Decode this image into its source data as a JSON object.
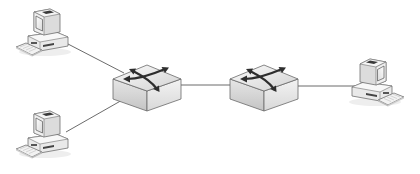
{
  "diagram": {
    "type": "network-topology",
    "background": "#ffffff",
    "colors": {
      "link": "#555555",
      "device_light": "#f4f4f4",
      "device_mid": "#d6d6d6",
      "device_dark": "#9a9a9a",
      "outline": "#6a6a6a",
      "arrow": "#3a3a3a"
    },
    "nodes": [
      {
        "id": "pc-top-left",
        "kind": "computer",
        "icon": "desktop-computer-icon",
        "x": 12,
        "y": 6,
        "facing": "right"
      },
      {
        "id": "pc-bottom-left",
        "kind": "computer",
        "icon": "desktop-computer-icon",
        "x": 12,
        "y": 108,
        "facing": "right"
      },
      {
        "id": "switch-1",
        "kind": "switch",
        "icon": "network-switch-icon",
        "x": 113,
        "y": 58
      },
      {
        "id": "switch-2",
        "kind": "switch",
        "icon": "network-switch-icon",
        "x": 230,
        "y": 58
      },
      {
        "id": "pc-right",
        "kind": "computer",
        "icon": "desktop-computer-icon",
        "x": 348,
        "y": 56,
        "facing": "left"
      }
    ],
    "links": [
      {
        "from": "pc-top-left",
        "to": "switch-1"
      },
      {
        "from": "pc-bottom-left",
        "to": "switch-1"
      },
      {
        "from": "switch-1",
        "to": "switch-2"
      },
      {
        "from": "switch-2",
        "to": "pc-right"
      }
    ]
  }
}
